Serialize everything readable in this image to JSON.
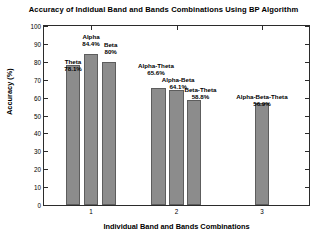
{
  "chart_data": {
    "type": "bar",
    "title": "Accuracy of Indidual Band and Bands Combinations Using BP Algorithm",
    "xlabel": "Individual Band and Bands Combinations",
    "ylabel": "Accuracy (%)",
    "ylim": [
      0,
      100
    ],
    "xlim": [
      0.45,
      3.55
    ],
    "grid": false,
    "legend": "none",
    "yticks": [
      0,
      10,
      20,
      30,
      40,
      50,
      60,
      70,
      80,
      90,
      100
    ],
    "ytick_labels": [
      "0",
      "10",
      "20",
      "30",
      "40",
      "50",
      "60",
      "70",
      "80",
      "90",
      "100"
    ],
    "xticks": [
      1,
      2,
      3
    ],
    "xtick_labels": [
      "1",
      "2",
      "3"
    ],
    "categories": [
      "Theta",
      "Alpha",
      "Beta",
      "Alpha-Theta",
      "Alpha-Beta",
      "Beta-Theta",
      "Alpha-Beta-Theta"
    ],
    "values": [
      78.1,
      84.4,
      80,
      65.6,
      64.1,
      58.8,
      56.9
    ],
    "value_labels": [
      "78.1%",
      "84.4%",
      "80%",
      "65.6%",
      "64.1%",
      "58.8%",
      "56.9%"
    ],
    "bars": [
      {
        "name": "Theta",
        "value": 78.1,
        "value_label": "78.1%",
        "x": 0.79,
        "label_x": 0.79,
        "label_top": 74.0
      },
      {
        "name": "Alpha",
        "value": 84.4,
        "value_label": "84.4%",
        "x": 1.0,
        "label_x": 1.0,
        "label_top": 88.0
      },
      {
        "name": "Beta",
        "value": 80.0,
        "value_label": "80%",
        "x": 1.21,
        "label_x": 1.23,
        "label_top": 83.5
      },
      {
        "name": "Alpha-Theta",
        "value": 65.6,
        "value_label": "65.6%",
        "x": 1.79,
        "label_x": 1.76,
        "label_top": 71.5
      },
      {
        "name": "Alpha-Beta",
        "value": 64.1,
        "value_label": "64.1%",
        "x": 2.0,
        "label_x": 2.02,
        "label_top": 64.0
      },
      {
        "name": "Beta-Theta",
        "value": 58.8,
        "value_label": "58.8%",
        "x": 2.21,
        "label_x": 2.28,
        "label_top": 58.0
      },
      {
        "name": "Alpha-Beta-Theta",
        "value": 56.9,
        "value_label": "56.9%",
        "x": 3.0,
        "label_x": 3.0,
        "label_top": 54.0
      }
    ],
    "bar_color": "#8c8c8c",
    "bar_edge_color": "#5d5d5d",
    "bar_width": 0.165,
    "axis_color": "#2b2b2b",
    "background_color": "#ffffff"
  }
}
